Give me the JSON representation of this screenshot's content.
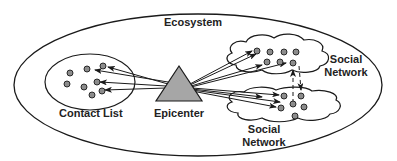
{
  "diagram": {
    "labels": {
      "ecosystem": "Ecosystem",
      "contact_list": "Contact List",
      "epicenter": "Epicenter",
      "social_network_top": [
        "Social",
        "Network"
      ],
      "social_network_bottom": [
        "Social",
        "Network"
      ]
    },
    "colors": {
      "stroke": "#1a1a1a",
      "node_fill": "#8c8c8c",
      "triangle_fill": "#a6a6a6",
      "background": "#ffffff"
    },
    "nodes": {
      "contact_list": 8,
      "social_network_top": 7,
      "social_network_bottom": 5
    }
  }
}
